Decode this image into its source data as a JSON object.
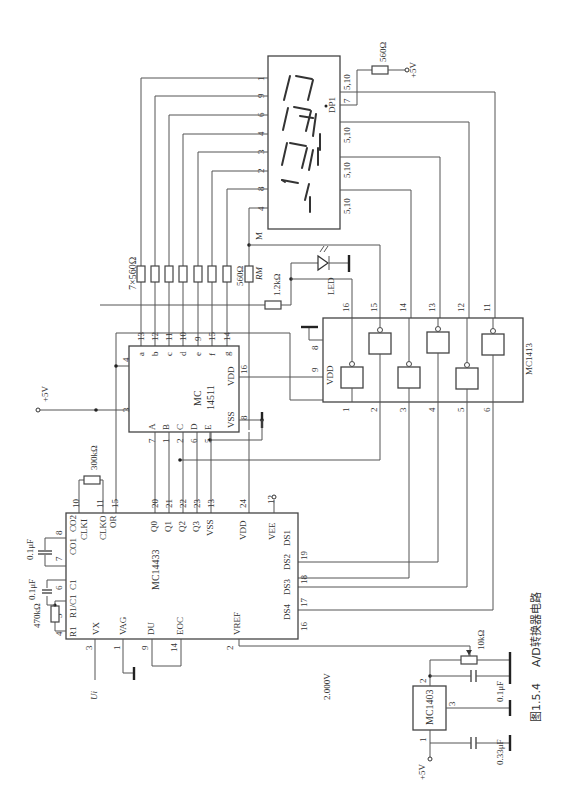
{
  "figure": {
    "caption_number": "图1.5.4",
    "caption_title": "A/D转换器电路",
    "orientation": "rotated 90° counter-clockwise"
  },
  "chips": {
    "adc": {
      "name": "MC14433",
      "pins_left": [
        {
          "num": "4",
          "label": "R1"
        },
        {
          "num": "5",
          "label": "R1/C1"
        },
        {
          "num": "6",
          "label": "C1"
        },
        {
          "num": "7",
          "label": "CO1"
        },
        {
          "num": "8",
          "label": "CO2"
        },
        {
          "num": "10",
          "label": "CLKI"
        },
        {
          "num": "11",
          "label": "CLKO"
        },
        {
          "num": "15",
          "label": "OR"
        }
      ],
      "pins_bottom": [
        {
          "num": "3",
          "label": "VX"
        },
        {
          "num": "1",
          "label": "VAG"
        },
        {
          "num": "9",
          "label": "DU"
        },
        {
          "num": "14",
          "label": "EOC"
        },
        {
          "num": "2",
          "label": "VREF"
        }
      ],
      "pins_top": [
        {
          "num": "20",
          "label": "Q0"
        },
        {
          "num": "21",
          "label": "Q1"
        },
        {
          "num": "22",
          "label": "Q2"
        },
        {
          "num": "23",
          "label": "Q3"
        },
        {
          "num": "13",
          "label": "VSS"
        },
        {
          "num": "24",
          "label": "VDD"
        },
        {
          "num": "12",
          "label": "VEE"
        }
      ],
      "pins_right": [
        {
          "num": "19",
          "label": "DS1"
        },
        {
          "num": "18",
          "label": "DS2"
        },
        {
          "num": "17",
          "label": "DS3"
        },
        {
          "num": "16",
          "label": "DS4"
        }
      ]
    },
    "decoder": {
      "name_line1": "MC",
      "name_line2": "14511",
      "outputs": [
        {
          "num": "13",
          "label": "a"
        },
        {
          "num": "12",
          "label": "b"
        },
        {
          "num": "11",
          "label": "c"
        },
        {
          "num": "10",
          "label": "d"
        },
        {
          "num": "9",
          "label": "e"
        },
        {
          "num": "15",
          "label": "f"
        },
        {
          "num": "14",
          "label": "g"
        }
      ],
      "inputs": [
        {
          "num": "7",
          "label": "A"
        },
        {
          "num": "1",
          "label": "B"
        },
        {
          "num": "2",
          "label": "C"
        },
        {
          "num": "6",
          "label": "D"
        },
        {
          "num": "5",
          "label": "E"
        }
      ],
      "pin_4": "4",
      "pin_3": "3",
      "vdd": {
        "num": "16",
        "label": "VDD"
      },
      "vss": {
        "num": "8",
        "label": "VSS"
      }
    },
    "driver": {
      "name": "MC1413",
      "top_pins": [
        "16",
        "15",
        "14",
        "13",
        "12",
        "11"
      ],
      "bottom_pins": [
        "1",
        "2",
        "3",
        "4",
        "5",
        "6"
      ],
      "pin_8": "8",
      "pin_9": "9",
      "vdd_label": "VDD"
    },
    "reference": {
      "name": "MC1403",
      "pin_1": "1",
      "pin_2": "2",
      "pin_3": "3"
    }
  },
  "display": {
    "segment_pins": [
      "1",
      "9",
      "6",
      "4",
      "3",
      "2",
      "8",
      "4"
    ],
    "common_pins": [
      "5,10",
      "7",
      "5,10",
      "5,10",
      "5,10"
    ],
    "dp_label": "DP1"
  },
  "components": {
    "r_470k": "470kΩ",
    "c_01_a": "0.1μF",
    "c_01_b": "0.1μF",
    "r_300k": "300kΩ",
    "r_7x560": "7×560Ω",
    "r_560_m": "560Ω",
    "rm_label": "RM",
    "r_1_2k": "1.2kΩ",
    "led_label": "LED",
    "m_label": "M",
    "r_560_dp": "560Ω",
    "pot_10k": "10kΩ",
    "c_01_ref": "0.1μF",
    "c_033": "0.33μF",
    "vref_value": "2.000V",
    "ui_label": "Ui"
  },
  "supplies": {
    "vcc_top": "+5V",
    "vcc_dp": "+5V",
    "vcc_ref": "+5V"
  }
}
